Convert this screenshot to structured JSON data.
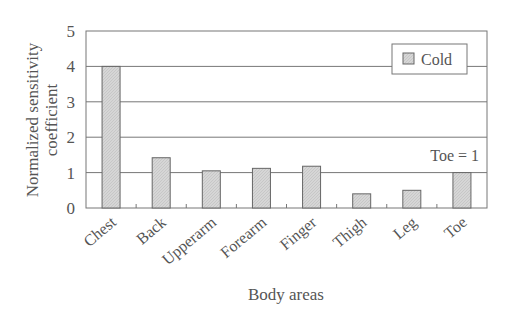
{
  "chart_data": {
    "type": "bar",
    "title": "",
    "xlabel": "Body areas",
    "ylabel": "Normalized sensitivity coefficient",
    "ylabel_lines": [
      "Normalized sensitivity",
      "coefficient"
    ],
    "categories": [
      "Chest",
      "Back",
      "Upperarm",
      "Forearm",
      "Finger",
      "Thigh",
      "Leg",
      "Toe"
    ],
    "series": [
      {
        "name": "Cold",
        "values": [
          4.0,
          1.42,
          1.05,
          1.12,
          1.18,
          0.4,
          0.5,
          1.0
        ],
        "color": "#d9d9d9"
      }
    ],
    "ylim": [
      0,
      5
    ],
    "yticks": [
      "0",
      "1",
      "2",
      "3",
      "4",
      "5"
    ],
    "grid": true,
    "legend_position": "upper right",
    "annotation": "Toe = 1"
  }
}
